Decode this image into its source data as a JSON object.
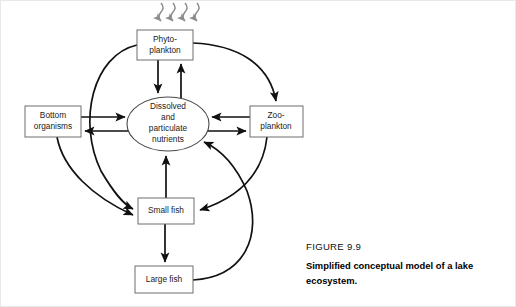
{
  "figure": {
    "number_label": "FIGURE 9.9",
    "caption_line1": "Simplified conceptual model of a lake",
    "caption_line2": "ecosystem."
  },
  "diagram": {
    "background_color": "#ffffff",
    "line_color": "#111111",
    "box_stroke_color": "#6d6d6d",
    "sunlight_color": "#8d8d8d",
    "nodes": [
      {
        "id": "phytoplankton",
        "shape": "rect",
        "line1": "Phyto-",
        "line2": "plankton",
        "x": 136,
        "y": 29,
        "w": 56,
        "h": 30
      },
      {
        "id": "nutrients",
        "shape": "ellipse",
        "line1": "Dissolved",
        "line2": "and",
        "line3": "particulate",
        "line4": "nutrients",
        "cx": 167,
        "cy": 123,
        "rx": 41,
        "ry": 27
      },
      {
        "id": "bottom-organisms",
        "shape": "rect",
        "line1": "Bottom",
        "line2": "organisms",
        "x": 24,
        "y": 105,
        "w": 56,
        "h": 31
      },
      {
        "id": "zooplankton",
        "shape": "rect",
        "line1": "Zoo-",
        "line2": "plankton",
        "x": 249,
        "y": 105,
        "w": 53,
        "h": 31
      },
      {
        "id": "small-fish",
        "shape": "rect",
        "line1": "Small fish",
        "x": 137,
        "y": 197,
        "w": 56,
        "h": 26
      },
      {
        "id": "large-fish",
        "shape": "rect",
        "line1": "Large fish",
        "x": 134,
        "y": 265,
        "w": 58,
        "h": 27
      }
    ],
    "sunlight": {
      "label": "sunlight-squiggly-arrows",
      "count": 4,
      "x_positions": [
        160,
        172,
        184,
        196
      ],
      "top_y": 2,
      "bottom_y": 27
    },
    "edges": [
      {
        "from": "phytoplankton",
        "to": "nutrients",
        "style": "straight"
      },
      {
        "from": "nutrients",
        "to": "phytoplankton",
        "style": "straight"
      },
      {
        "from": "bottom-organisms",
        "to": "nutrients",
        "style": "straight"
      },
      {
        "from": "nutrients",
        "to": "bottom-organisms",
        "style": "straight"
      },
      {
        "from": "zooplankton",
        "to": "nutrients",
        "style": "straight"
      },
      {
        "from": "nutrients",
        "to": "zooplankton",
        "style": "straight"
      },
      {
        "from": "small-fish",
        "to": "nutrients",
        "style": "straight"
      },
      {
        "from": "small-fish",
        "to": "large-fish",
        "style": "straight"
      },
      {
        "from": "phytoplankton",
        "to": "zooplankton",
        "style": "curved"
      },
      {
        "from": "phytoplankton",
        "to": "small-fish",
        "style": "curved"
      },
      {
        "from": "bottom-organisms",
        "to": "small-fish",
        "style": "curved"
      },
      {
        "from": "zooplankton",
        "to": "small-fish",
        "style": "curved"
      },
      {
        "from": "large-fish",
        "to": "nutrients",
        "style": "curved"
      }
    ]
  }
}
